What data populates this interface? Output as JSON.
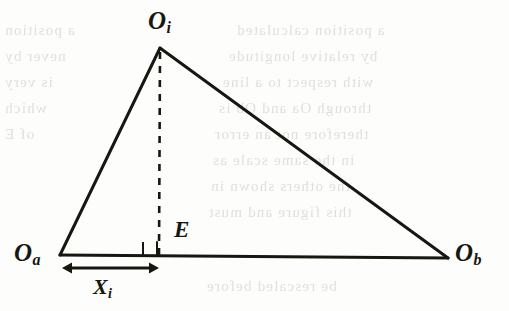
{
  "figure": {
    "kind": "geometry-diagram",
    "background_color": "#fdfdfc",
    "ink_color": "#17160f",
    "labels": {
      "apex": {
        "base": "O",
        "subscript": "i"
      },
      "base_left": {
        "base": "O",
        "subscript": "a"
      },
      "base_right": {
        "base": "O",
        "subscript": "b"
      },
      "altitude_foot": {
        "base": "E",
        "subscript": ""
      },
      "distance": {
        "base": "X",
        "subscript": "i"
      }
    },
    "geometry": {
      "vertex_apex": [
        160,
        48
      ],
      "vertex_base_left": [
        60,
        255
      ],
      "vertex_base_right": [
        448,
        258
      ],
      "altitude_foot": [
        159,
        256
      ],
      "right_angle_marker": {
        "x": 143,
        "y": 242,
        "size": 14
      },
      "dimension_arrow": {
        "x1": 62,
        "x2": 159,
        "y": 268
      }
    },
    "strokes": {
      "triangle_side_width": 3.0,
      "base_width": 3.2,
      "altitude_width": 2.6,
      "altitude_dash": "7 7",
      "marker_width": 2.0
    }
  },
  "bleed_through": {
    "note": "faint mirrored text showing through from the reverse side of the scanned page",
    "color": "#c9c7c4",
    "lines": [
      {
        "text": "a position calculated",
        "left": 236,
        "top": 22,
        "size": 15
      },
      {
        "text": "by relative longitude",
        "left": 228,
        "top": 48,
        "size": 15
      },
      {
        "text": "with respect to a line",
        "left": 222,
        "top": 74,
        "size": 15
      },
      {
        "text": "through Oa and Ob is",
        "left": 218,
        "top": 100,
        "size": 15
      },
      {
        "text": "therefore not an error",
        "left": 214,
        "top": 126,
        "size": 15
      },
      {
        "text": "in the same scale as",
        "left": 212,
        "top": 152,
        "size": 15
      },
      {
        "text": "the others shown in",
        "left": 210,
        "top": 178,
        "size": 15
      },
      {
        "text": "this figure and must",
        "left": 208,
        "top": 204,
        "size": 15
      },
      {
        "text": "be rescaled before",
        "left": 206,
        "top": 278,
        "size": 15
      },
      {
        "text": "a position",
        "left": 4,
        "top": 22,
        "size": 15
      },
      {
        "text": "never by",
        "left": 4,
        "top": 48,
        "size": 15
      },
      {
        "text": "is very",
        "left": 4,
        "top": 74,
        "size": 15
      },
      {
        "text": "which",
        "left": 4,
        "top": 100,
        "size": 15
      },
      {
        "text": "of E",
        "left": 4,
        "top": 126,
        "size": 15
      }
    ]
  }
}
